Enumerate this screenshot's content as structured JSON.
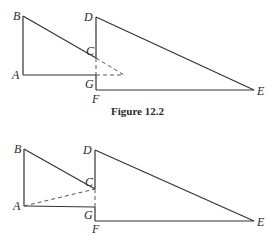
{
  "caption": "Figure 12.2",
  "figure_top": {
    "labels": {
      "B": "B",
      "A": "A",
      "D": "D",
      "C": "C",
      "G": "G",
      "F": "F",
      "E": "E"
    },
    "points": {
      "A": [
        23,
        75
      ],
      "B": [
        23,
        16
      ],
      "C": [
        96,
        58
      ],
      "D": [
        96,
        17
      ],
      "E": [
        254,
        90
      ],
      "F": [
        96,
        90
      ],
      "G": [
        96,
        75
      ],
      "X": [
        124,
        75
      ]
    },
    "solid_segments": [
      [
        "A",
        "B"
      ],
      [
        "B",
        "C"
      ],
      [
        "A",
        "G"
      ],
      [
        "D",
        "F"
      ],
      [
        "F",
        "E"
      ],
      [
        "D",
        "E"
      ]
    ],
    "dashed_segments": [
      [
        "C",
        "X"
      ],
      [
        "G",
        "X"
      ],
      [
        "C",
        "G"
      ]
    ]
  },
  "figure_bottom": {
    "labels": {
      "B": "B",
      "A": "A",
      "D": "D",
      "C": "C",
      "G": "G",
      "F": "F",
      "E": "E"
    },
    "points": {
      "A": [
        24,
        206
      ],
      "B": [
        24,
        149
      ],
      "C": [
        95,
        189
      ],
      "D": [
        95,
        150
      ],
      "E": [
        254,
        221
      ],
      "F": [
        95,
        221
      ],
      "G": [
        95,
        207
      ]
    },
    "solid_segments": [
      [
        "A",
        "B"
      ],
      [
        "B",
        "C"
      ],
      [
        "A",
        "G"
      ],
      [
        "D",
        "F"
      ],
      [
        "F",
        "E"
      ],
      [
        "D",
        "E"
      ]
    ],
    "dashed_segments": [
      [
        "A",
        "C"
      ],
      [
        "C",
        "G"
      ]
    ]
  }
}
